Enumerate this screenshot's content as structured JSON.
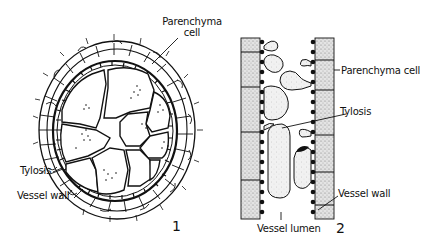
{
  "figure1": {
    "number": "1",
    "labels": {
      "parenchyma_line1": "Parenchyma",
      "parenchyma_line2": "cell",
      "tylosis": "Tylosis",
      "vessel_wall": "Vessel wall"
    }
  },
  "figure2": {
    "number": "2",
    "labels": {
      "parenchyma": "Parenchyma cell",
      "tylosis": "Tylosis",
      "vessel_wall": "Vessel wall",
      "vessel_lumen": "Vessel lumen"
    }
  },
  "colors": {
    "ink": "#111111",
    "stipple": "#d9d9d9",
    "background": "#ffffff"
  }
}
